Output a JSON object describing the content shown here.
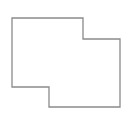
{
  "canvas": {
    "width": 131,
    "height": 115,
    "background": "#ffffff"
  },
  "shape": {
    "type": "polygon",
    "stroke": "#8a8a8a",
    "stroke_width": 1.3,
    "fill": "none",
    "points": "12,18 83,18 83,39 120,39 120,107 49,107 49,87 12,87"
  }
}
